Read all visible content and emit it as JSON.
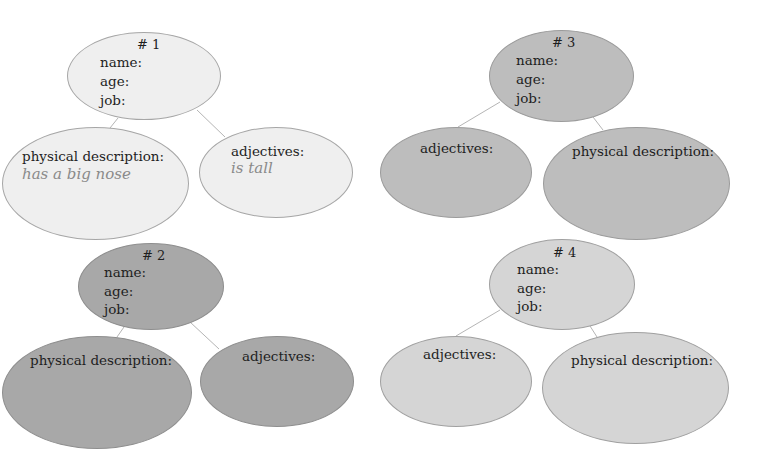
{
  "diagram": {
    "type": "character mind-map worksheet",
    "colors": {
      "group1": "#efefef",
      "group2": "#a8a8a8",
      "group3": "#bdbdbd",
      "group4": "#d5d5d5",
      "connector": "#b5b5b5",
      "hint_text": "#8a8a8a"
    },
    "groups": [
      {
        "id": "1",
        "number_label": "# 1",
        "fields": {
          "name": "name:",
          "age": "age:",
          "job": "job:"
        },
        "physical": {
          "label": "physical description:",
          "example": "has a big nose"
        },
        "adjectives": {
          "label": "adjectives:",
          "example": "is tall"
        }
      },
      {
        "id": "2",
        "number_label": "# 2",
        "fields": {
          "name": "name:",
          "age": "age:",
          "job": "job:"
        },
        "physical": {
          "label": "physical description:"
        },
        "adjectives": {
          "label": "adjectives:"
        }
      },
      {
        "id": "3",
        "number_label": "# 3",
        "fields": {
          "name": "name:",
          "age": "age:",
          "job": "job:"
        },
        "adjectives": {
          "label": "adjectives:"
        },
        "physical": {
          "label": "physical description:"
        }
      },
      {
        "id": "4",
        "number_label": "# 4",
        "fields": {
          "name": "name:",
          "age": "age:",
          "job": "job:"
        },
        "adjectives": {
          "label": "adjectives:"
        },
        "physical": {
          "label": "physical description:"
        }
      }
    ]
  }
}
